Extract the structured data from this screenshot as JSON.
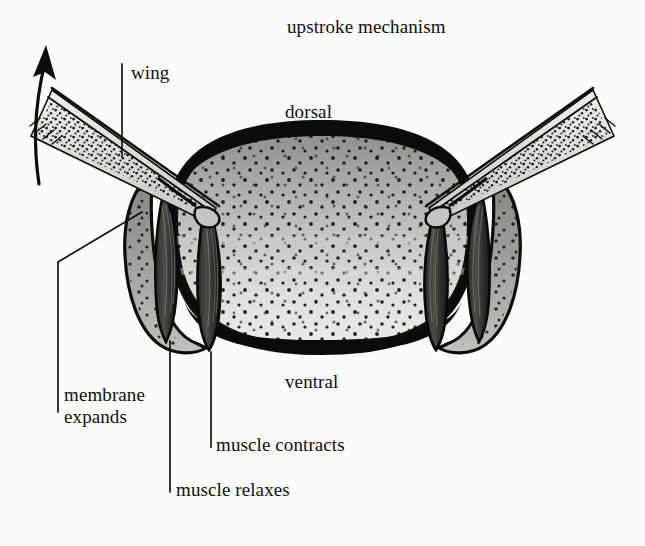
{
  "figure": {
    "title": "upstroke mechanism",
    "width": 645,
    "height": 546,
    "background_color": "#fcfcfb",
    "ink_color": "#100f0d"
  },
  "labels": {
    "title": "upstroke mechanism",
    "dorsal": "dorsal",
    "ventral": "ventral",
    "wing": "wing",
    "membrane_expands": "membrane\nexpands",
    "membrane_expands_line1": "membrane",
    "membrane_expands_line2": "expands",
    "muscle_contracts": "muscle contracts",
    "muscle_relaxes": "muscle relaxes"
  },
  "annotations": [
    {
      "name": "wing",
      "text": "wing",
      "leader": "vertical",
      "x": 122,
      "y_top": 64,
      "y_bottom": 157
    },
    {
      "name": "membrane-expands",
      "text": "membrane expands",
      "leader": "elbow",
      "x": 58,
      "y_top": 262,
      "y_bottom": 412
    },
    {
      "name": "muscle-relaxes",
      "text": "muscle relaxes",
      "leader": "vertical",
      "x": 170,
      "y_top": 341,
      "y_bottom": 492
    },
    {
      "name": "muscle-contracts",
      "text": "muscle contracts",
      "leader": "vertical",
      "x": 211,
      "y_top": 352,
      "y_bottom": 447
    }
  ],
  "arrow": {
    "name": "upstroke-direction-arrow",
    "direction": "up",
    "description": "curved arrow on the left indicating upward wing stroke",
    "tail_x": 38,
    "tail_y": 182,
    "head_x": 47,
    "head_y": 47
  },
  "anatomy": {
    "thorax": {
      "fill_light": "#d9d8d4",
      "fill_mid": "#b3b2ad",
      "rim_color": "#0d0d0b"
    },
    "wings": {
      "count": 2,
      "sides": [
        "left",
        "right"
      ],
      "texture": "stippled"
    },
    "muscles": {
      "count": 4,
      "left": [
        "relaxes",
        "relaxes"
      ],
      "right": [
        "contracts",
        "contracts"
      ],
      "shape": "spindle"
    }
  },
  "colors": {
    "ink": "#100f0d",
    "paper": "#fcfcfb",
    "shade_light": "#dbdad6",
    "shade_mid": "#b0afaa",
    "shade_dark": "#6f6e6a"
  }
}
